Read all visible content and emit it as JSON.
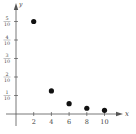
{
  "chart_data": {
    "type": "scatter",
    "title": "",
    "xlabel": "x",
    "ylabel": "y",
    "x": [
      2,
      4,
      6,
      8,
      10
    ],
    "values": [
      0.5,
      0.125,
      0.056,
      0.031,
      0.02
    ],
    "xlim": [
      0,
      11
    ],
    "ylim": [
      0,
      0.55
    ],
    "x_ticks": [
      "2",
      "4",
      "6",
      "8",
      "10"
    ],
    "y_ticks": [
      {
        "value": 0.1,
        "num": "1",
        "den": "10"
      },
      {
        "value": 0.2,
        "num": "2",
        "den": "10"
      },
      {
        "value": 0.3,
        "num": "3",
        "den": "10"
      },
      {
        "value": 0.4,
        "num": "4",
        "den": "10"
      },
      {
        "value": 0.5,
        "num": "5",
        "den": "10"
      }
    ],
    "grid": false,
    "legend": null,
    "colors": {
      "axis": "#555555",
      "point": "#111111",
      "text": "#444444"
    }
  }
}
